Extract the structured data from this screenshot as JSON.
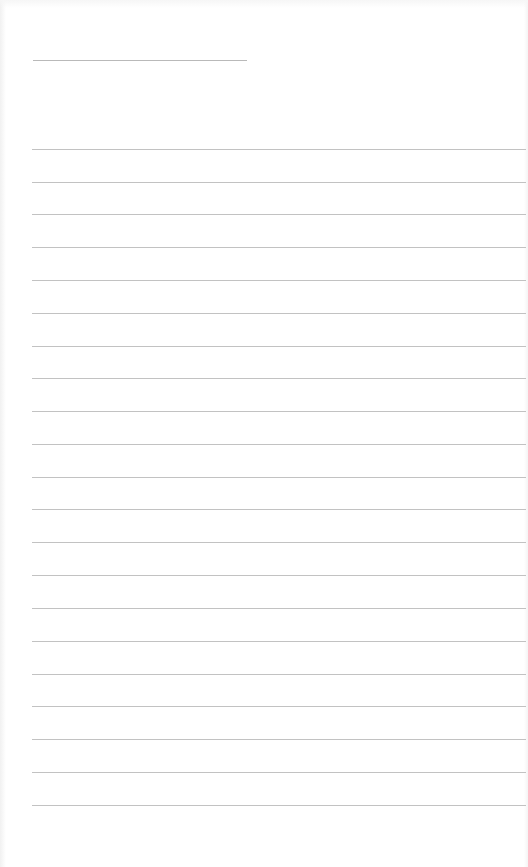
{
  "page": {
    "type": "lined-paper",
    "background": "#ffffff",
    "line_color": "#c2c2c2",
    "header_line": {
      "label": "",
      "x_start": 33,
      "x_end": 247,
      "y": 60
    },
    "ruled_lines": {
      "count": 21,
      "x_start": 32,
      "x_end": 526,
      "first_y": 148.7,
      "spacing": 32.8
    }
  }
}
